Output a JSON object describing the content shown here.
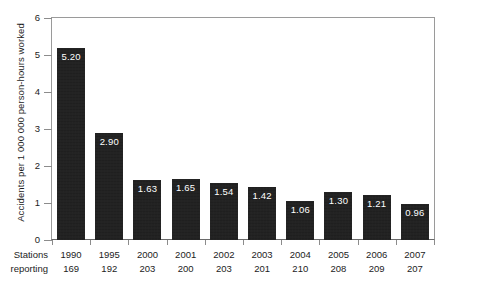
{
  "chart_data": {
    "type": "bar",
    "title": "",
    "xlabel": "",
    "ylabel": "Accidents per 1 000 000 person-hours worked",
    "ylim": [
      0,
      6
    ],
    "yticks": [
      0,
      1,
      2,
      3,
      4,
      5,
      6
    ],
    "ytick_labels": [
      "0",
      "1",
      "2",
      "3",
      "4",
      "5",
      "6"
    ],
    "grid": false,
    "legend": null,
    "categories": [
      "1990",
      "1995",
      "2000",
      "2001",
      "2002",
      "2003",
      "2004",
      "2005",
      "2006",
      "2007"
    ],
    "values": [
      5.2,
      2.9,
      1.63,
      1.65,
      1.54,
      1.42,
      1.06,
      1.3,
      1.21,
      0.96
    ],
    "value_labels": [
      "5.20",
      "2.90",
      "1.63",
      "1.65",
      "1.54",
      "1.42",
      "1.06",
      "1.30",
      "1.21",
      "0.96"
    ],
    "bar_color": "#1d1d1d",
    "value_label_color": "#ffffff",
    "secondary_axis": {
      "label_line_1": "Stations",
      "label_line_2": "reporting",
      "values": [
        "169",
        "192",
        "203",
        "200",
        "203",
        "201",
        "210",
        "208",
        "209",
        "207"
      ]
    }
  },
  "axis": {
    "y_title": "Accidents per 1 000 000 person-hours worked",
    "ticks": [
      "6",
      "5",
      "4",
      "3",
      "2",
      "1",
      "0"
    ]
  },
  "footer": {
    "head_line_1": "Stations",
    "head_line_2": "reporting"
  },
  "columns": [
    {
      "year": "1990",
      "stations": "169",
      "value": "5.20"
    },
    {
      "year": "1995",
      "stations": "192",
      "value": "2.90"
    },
    {
      "year": "2000",
      "stations": "203",
      "value": "1.63"
    },
    {
      "year": "2001",
      "stations": "200",
      "value": "1.65"
    },
    {
      "year": "2002",
      "stations": "203",
      "value": "1.54"
    },
    {
      "year": "2003",
      "stations": "201",
      "value": "1.42"
    },
    {
      "year": "2004",
      "stations": "210",
      "value": "1.06"
    },
    {
      "year": "2005",
      "stations": "208",
      "value": "1.30"
    },
    {
      "year": "2006",
      "stations": "209",
      "value": "1.21"
    },
    {
      "year": "2007",
      "stations": "207",
      "value": "0.96"
    }
  ]
}
